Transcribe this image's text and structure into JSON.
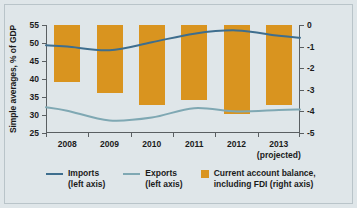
{
  "chart_data": {
    "type": "bar",
    "title": "",
    "subtitle": "",
    "xlabel": "",
    "ylabel": "Simple averages, % of GDP",
    "ylabel_right": "",
    "categories": [
      "2008",
      "2009",
      "2010",
      "2011",
      "2012",
      "2013"
    ],
    "category_sublabels": [
      "",
      "",
      "",
      "",
      "",
      "(projected)"
    ],
    "ylim": [
      25,
      55
    ],
    "yticks": [
      25,
      30,
      35,
      40,
      45,
      50,
      55
    ],
    "ylim_right": [
      -5,
      0
    ],
    "yticks_right": [
      0,
      -1,
      -2,
      -3,
      -4,
      -5
    ],
    "grid": false,
    "legend_position": "bottom",
    "series": [
      {
        "name": "Imports",
        "sublabel": "(left axis)",
        "type": "line",
        "axis": "left",
        "color": "#3e6e8e",
        "values": [
          49.0,
          48.0,
          50.2,
          52.6,
          53.5,
          52.0
        ]
      },
      {
        "name": "Exports",
        "sublabel": "(left axis)",
        "type": "line",
        "axis": "left",
        "color": "#7fa8b3",
        "values": [
          31.2,
          28.5,
          29.3,
          31.9,
          31.0,
          31.4
        ]
      },
      {
        "name": "Current account balance,",
        "sublabel": "including FDI (right axis)",
        "type": "bar",
        "axis": "right",
        "color": "#d9941f",
        "values": [
          -2.65,
          -3.15,
          -3.7,
          -3.45,
          -4.1,
          -3.7
        ]
      }
    ]
  },
  "axes": {
    "left_title": "Simple averages, % of GDP",
    "left_ticks": [
      "55",
      "50",
      "45",
      "40",
      "35",
      "30",
      "25"
    ],
    "right_ticks": [
      "0",
      "-1",
      "-2",
      "-3",
      "-4",
      "-5"
    ],
    "x_ticks": [
      "2008",
      "2009",
      "2010",
      "2011",
      "2012",
      "2013"
    ],
    "x_tick_sub": [
      "",
      "",
      "",
      "",
      "",
      "(projected)"
    ]
  },
  "legend": {
    "items": [
      {
        "label": "Imports",
        "sublabel": "(left axis)",
        "marker": "line",
        "color": "#3e6e8e"
      },
      {
        "label": "Exports",
        "sublabel": "(left axis)",
        "marker": "line",
        "color": "#7fa8b3"
      },
      {
        "label": "Current account balance,",
        "sublabel": "including FDI (right axis)",
        "marker": "box",
        "color": "#d9941f"
      }
    ]
  },
  "colors": {
    "background": "#dfe6e9",
    "bar": "#d9941f",
    "imports_line": "#3e6e8e",
    "exports_line": "#7fa8b3",
    "axis": "#5a5f62",
    "text": "#1b1b1b"
  }
}
